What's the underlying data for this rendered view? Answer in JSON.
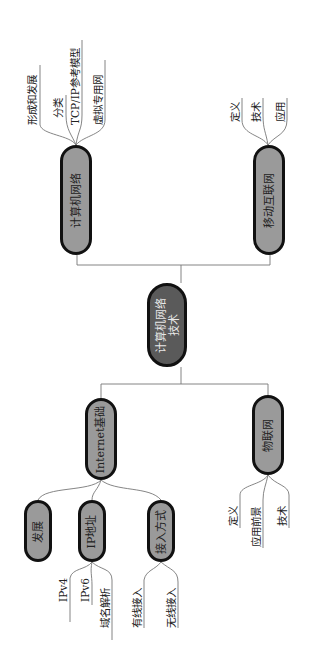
{
  "root": {
    "label_line1": "计算机网络",
    "label_line2": "技术"
  },
  "branches": [
    {
      "id": "computer-network",
      "label": "计算机网络",
      "children": [
        "形成和发展",
        "分类",
        "TCP/IP参考模型",
        "虚拟专用网"
      ]
    },
    {
      "id": "mobile-internet",
      "label": "移动互联网",
      "children": [
        "定义",
        "技术",
        "应用"
      ]
    },
    {
      "id": "internet-basics",
      "label": "Internet基础",
      "children": [
        {
          "label": "发展",
          "children": []
        },
        {
          "label": "IP地址",
          "children": [
            "IPv4",
            "IPv6",
            "域名解析"
          ]
        },
        {
          "label": "接入方式",
          "children": [
            "有线接入",
            "无线接入"
          ]
        }
      ]
    },
    {
      "id": "iot",
      "label": "物联网",
      "children": [
        "定义",
        "应用前景",
        "技术"
      ]
    }
  ],
  "colors": {
    "root_fill": "#5a5a5a",
    "node_fill": "#9a9a9a",
    "border": "#111111",
    "line": "#777777"
  }
}
